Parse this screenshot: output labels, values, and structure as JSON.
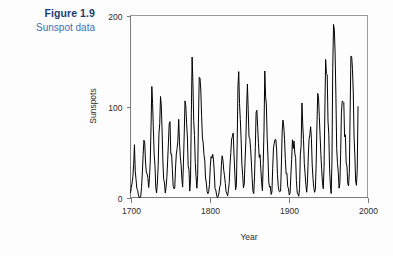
{
  "caption": {
    "figure_number": "Figure 1.9",
    "figure_title": "Sunspot data",
    "number_color": "#1b3b73",
    "title_color": "#3f6fb5"
  },
  "chart_data": {
    "type": "line",
    "title": "",
    "subtitle": "",
    "xlabel": "Year",
    "ylabel": "Sunspots",
    "xlim": [
      1700,
      2000
    ],
    "ylim": [
      0,
      200
    ],
    "xticks": [
      1700,
      1800,
      1900,
      2000
    ],
    "xticklabels": [
      "1700",
      "1800",
      "1900",
      "2000"
    ],
    "yticks": [
      0,
      100,
      200
    ],
    "yticklabels": [
      "0",
      "100",
      "200"
    ],
    "grid": false,
    "legend": null,
    "line_color": "#000000",
    "line_width": 1,
    "series": [
      {
        "name": "Sunspots",
        "x": [
          1700,
          1701,
          1702,
          1703,
          1704,
          1705,
          1706,
          1707,
          1708,
          1709,
          1710,
          1711,
          1712,
          1713,
          1714,
          1715,
          1716,
          1717,
          1718,
          1719,
          1720,
          1721,
          1722,
          1723,
          1724,
          1725,
          1726,
          1727,
          1728,
          1729,
          1730,
          1731,
          1732,
          1733,
          1734,
          1735,
          1736,
          1737,
          1738,
          1739,
          1740,
          1741,
          1742,
          1743,
          1744,
          1745,
          1746,
          1747,
          1748,
          1749,
          1750,
          1751,
          1752,
          1753,
          1754,
          1755,
          1756,
          1757,
          1758,
          1759,
          1760,
          1761,
          1762,
          1763,
          1764,
          1765,
          1766,
          1767,
          1768,
          1769,
          1770,
          1771,
          1772,
          1773,
          1774,
          1775,
          1776,
          1777,
          1778,
          1779,
          1780,
          1781,
          1782,
          1783,
          1784,
          1785,
          1786,
          1787,
          1788,
          1789,
          1790,
          1791,
          1792,
          1793,
          1794,
          1795,
          1796,
          1797,
          1798,
          1799,
          1800,
          1801,
          1802,
          1803,
          1804,
          1805,
          1806,
          1807,
          1808,
          1809,
          1810,
          1811,
          1812,
          1813,
          1814,
          1815,
          1816,
          1817,
          1818,
          1819,
          1820,
          1821,
          1822,
          1823,
          1824,
          1825,
          1826,
          1827,
          1828,
          1829,
          1830,
          1831,
          1832,
          1833,
          1834,
          1835,
          1836,
          1837,
          1838,
          1839,
          1840,
          1841,
          1842,
          1843,
          1844,
          1845,
          1846,
          1847,
          1848,
          1849,
          1850,
          1851,
          1852,
          1853,
          1854,
          1855,
          1856,
          1857,
          1858,
          1859,
          1860,
          1861,
          1862,
          1863,
          1864,
          1865,
          1866,
          1867,
          1868,
          1869,
          1870,
          1871,
          1872,
          1873,
          1874,
          1875,
          1876,
          1877,
          1878,
          1879,
          1880,
          1881,
          1882,
          1883,
          1884,
          1885,
          1886,
          1887,
          1888,
          1889,
          1890,
          1891,
          1892,
          1893,
          1894,
          1895,
          1896,
          1897,
          1898,
          1899,
          1900,
          1901,
          1902,
          1903,
          1904,
          1905,
          1906,
          1907,
          1908,
          1909,
          1910,
          1911,
          1912,
          1913,
          1914,
          1915,
          1916,
          1917,
          1918,
          1919,
          1920,
          1921,
          1922,
          1923,
          1924,
          1925,
          1926,
          1927,
          1928,
          1929,
          1930,
          1931,
          1932,
          1933,
          1934,
          1935,
          1936,
          1937,
          1938,
          1939,
          1940,
          1941,
          1942,
          1943,
          1944,
          1945,
          1946,
          1947,
          1948,
          1949,
          1950,
          1951,
          1952,
          1953,
          1954,
          1955,
          1956,
          1957,
          1958,
          1959,
          1960,
          1961,
          1962,
          1963,
          1964,
          1965,
          1966,
          1967,
          1968,
          1969,
          1970,
          1971,
          1972,
          1973,
          1974,
          1975,
          1976,
          1977,
          1978,
          1979,
          1980,
          1981,
          1982,
          1983,
          1984,
          1985,
          1986,
          1987,
          1988
        ],
        "values": [
          5,
          11,
          16,
          23,
          36,
          58,
          29,
          20,
          10,
          8,
          3,
          0,
          0,
          2,
          11,
          27,
          47,
          63,
          60,
          39,
          28,
          26,
          22,
          11,
          21,
          40,
          78,
          122,
          103,
          73,
          47,
          35,
          11,
          5,
          16,
          34,
          70,
          81,
          111,
          101,
          73,
          40,
          20,
          16,
          5,
          11,
          22,
          40,
          60,
          80.9,
          83.4,
          47.7,
          47.8,
          30.7,
          12.2,
          9.6,
          10.2,
          32.4,
          47.6,
          54,
          62.9,
          85.9,
          61.2,
          45.1,
          36.4,
          20.9,
          11.4,
          37.8,
          69.8,
          106.1,
          100.8,
          81.6,
          66.5,
          34.8,
          30.6,
          7,
          19.8,
          92.5,
          154.4,
          125.9,
          84.8,
          68.1,
          38.5,
          22.8,
          10.2,
          24.1,
          82.9,
          132,
          130.9,
          118.1,
          89.9,
          66.6,
          60,
          46.9,
          41,
          21.3,
          16,
          6.4,
          4.1,
          6.8,
          14.5,
          34,
          45,
          43.1,
          47.5,
          42.2,
          28.1,
          10.1,
          8.1,
          2.5,
          0,
          1.4,
          5,
          12.2,
          13.9,
          35.4,
          45.8,
          41.1,
          30.1,
          23.9,
          15.6,
          6.6,
          4,
          1.8,
          8.5,
          16.6,
          36.3,
          49.6,
          64.2,
          67,
          70.9,
          47.8,
          27.5,
          8.5,
          13.2,
          56.9,
          121.5,
          138.3,
          103.2,
          85.7,
          64.6,
          36.7,
          24.2,
          10.7,
          15,
          40.1,
          61.5,
          98.5,
          124.7,
          96.3,
          66.6,
          64.5,
          54.1,
          39,
          20.6,
          6.7,
          4.3,
          22.7,
          54.8,
          93.8,
          95.8,
          77.2,
          59.1,
          44,
          47,
          30.5,
          16.3,
          7.3,
          37.6,
          74,
          139,
          111.2,
          101.6,
          66.2,
          44.7,
          17,
          11.3,
          12.4,
          3.4,
          6,
          32.3,
          54.3,
          59.7,
          63.7,
          63.5,
          52.2,
          25.4,
          13.1,
          6.8,
          6.3,
          7.1,
          35.6,
          73,
          85.1,
          78,
          64,
          41.8,
          26.2,
          26.7,
          12.1,
          9.5,
          2.7,
          5,
          24.4,
          42,
          63.5,
          53.8,
          62,
          48.5,
          43.9,
          18.6,
          5.7,
          3.6,
          1.4,
          9.6,
          47.4,
          57.1,
          103.9,
          80.6,
          63.6,
          37.6,
          26.1,
          14.2,
          5.8,
          16.7,
          44.3,
          63.9,
          69,
          77.8,
          64.9,
          35.7,
          21.2,
          11.1,
          5.7,
          8.7,
          36.1,
          79.7,
          114.4,
          109.6,
          88.8,
          67.8,
          47.5,
          30.6,
          16.3,
          9.6,
          33.2,
          92.6,
          151.6,
          136.3,
          134.7,
          83.9,
          69.4,
          31.5,
          13.9,
          4.4,
          38,
          141.7,
          190.2,
          184.8,
          159,
          112.3,
          53.9,
          37.6,
          27.9,
          10.2,
          15.1,
          47,
          93.8,
          105.9,
          105.5,
          104.5,
          66.6,
          68.9,
          38,
          34.5,
          15.5,
          12.6,
          27.5,
          92.5,
          155.4,
          154.6,
          140.4,
          115.9,
          66.6,
          45.9,
          17.9,
          13.4,
          29.4,
          100.2
        ]
      }
    ]
  },
  "axes": {
    "y_axis_label": "Sunspots",
    "x_axis_label": "Year"
  }
}
